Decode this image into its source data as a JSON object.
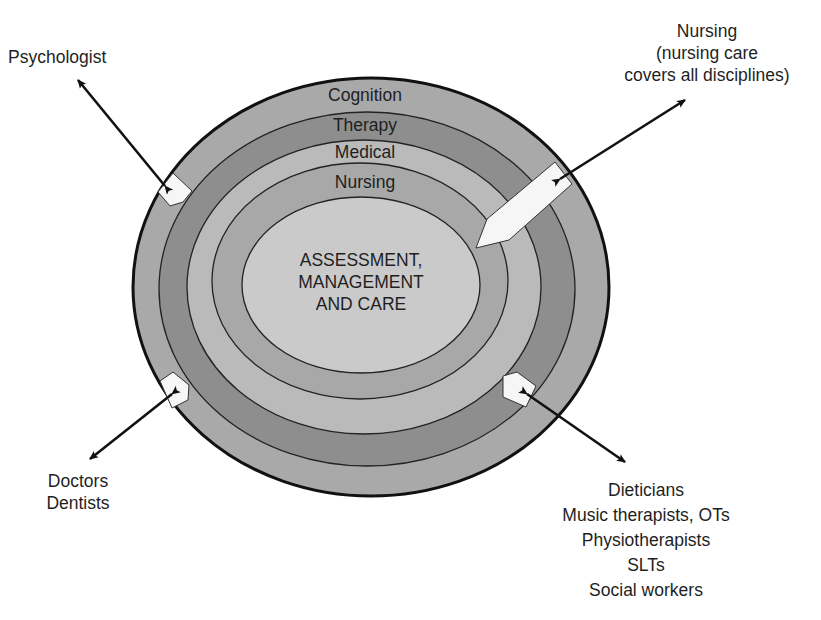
{
  "diagram": {
    "title": "",
    "center": {
      "lines": [
        "ASSESSMENT,",
        "MANAGEMENT",
        "AND CARE"
      ]
    },
    "rings": [
      {
        "label": "Cognition",
        "fill": "#a9a9a9"
      },
      {
        "label": "Therapy",
        "fill": "#8c8c8c"
      },
      {
        "label": "Medical",
        "fill": "#b9b9b9"
      },
      {
        "label": "Nursing",
        "fill": "#a6a6a6"
      }
    ],
    "center_fill": "#c9c9c9",
    "outer_stroke": "#111111",
    "callouts": {
      "psychologist": {
        "lines": [
          "Psychologist"
        ]
      },
      "nursing": {
        "lines": [
          "Nursing",
          "(nursing care",
          "covers all disciplines)"
        ]
      },
      "doctors": {
        "lines": [
          "Doctors",
          "Dentists"
        ]
      },
      "therapists": {
        "lines": [
          "Dieticians",
          "Music therapists, OTs",
          "Physiotherapists",
          "SLTs",
          "Social workers"
        ]
      }
    }
  }
}
